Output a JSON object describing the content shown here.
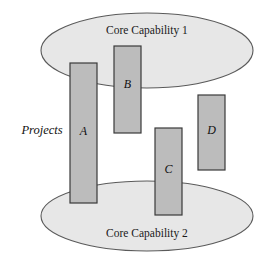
{
  "diagram": {
    "type": "venn-overlap-capability-projects",
    "width": 273,
    "height": 262,
    "background": "#ffffff",
    "colors": {
      "ellipse_fill": "#e7e7e7",
      "ellipse_stroke": "#5a5a5a",
      "rect_fill": "#bcbcbc",
      "rect_stroke": "#3a3a3a",
      "text": "#111111"
    },
    "side_label": {
      "text": "Projects",
      "x": 42,
      "y": 131
    },
    "ellipses": [
      {
        "id": "core-capability-1",
        "label": "Core Capability 1",
        "cx": 147,
        "cy": 50.5,
        "rx": 106,
        "ry": 37.5,
        "label_x": 147,
        "label_y": 31
      },
      {
        "id": "core-capability-2",
        "label": "Core Capability 2",
        "cx": 147,
        "cy": 216,
        "rx": 106,
        "ry": 35,
        "label_x": 147,
        "label_y": 234
      }
    ],
    "rectangles": [
      {
        "id": "project-a",
        "label": "A",
        "x": 70,
        "y": 63,
        "width": 27,
        "height": 140,
        "label_x": 83.5,
        "label_y": 132
      },
      {
        "id": "project-b",
        "label": "B",
        "x": 114,
        "y": 46,
        "width": 27,
        "height": 87,
        "label_x": 127.5,
        "label_y": 85
      },
      {
        "id": "project-c",
        "label": "C",
        "x": 155,
        "y": 128,
        "width": 27,
        "height": 87,
        "label_x": 168.5,
        "label_y": 170
      },
      {
        "id": "project-d",
        "label": "D",
        "x": 198,
        "y": 95,
        "width": 27,
        "height": 75,
        "label_x": 211.5,
        "label_y": 131
      }
    ]
  }
}
